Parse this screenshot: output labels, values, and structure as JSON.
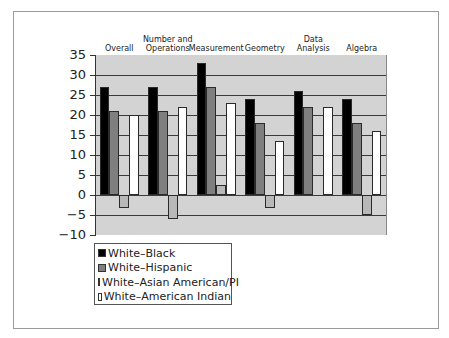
{
  "chart_data": {
    "type": "bar",
    "title": "",
    "xlabel": "",
    "ylabel": "",
    "ylim": [
      -10,
      35
    ],
    "yticks": [
      35,
      30,
      25,
      20,
      15,
      10,
      5,
      0,
      -5,
      -10
    ],
    "ytick_labels": [
      "35",
      "30",
      "25",
      "20",
      "15",
      "10",
      "5",
      "0",
      "−5",
      "−10"
    ],
    "grid": true,
    "legend_position": "bottom-left",
    "categories": [
      "Overall",
      "Number and Operations",
      "Measurement",
      "Geometry",
      "Data Analysis",
      "Algebra"
    ],
    "category_label_lines": [
      [
        "Overall"
      ],
      [
        "Number and",
        "Operations"
      ],
      [
        "Measurement"
      ],
      [
        "Geometry"
      ],
      [
        "Data",
        "Analysis"
      ],
      [
        "Algebra"
      ]
    ],
    "series": [
      {
        "name": "White–Black",
        "color": "#000000",
        "values": [
          27,
          27,
          33,
          24,
          26,
          24
        ]
      },
      {
        "name": "White–Hispanic",
        "color": "#7f7f7f",
        "values": [
          21,
          21,
          27,
          18,
          22,
          18
        ]
      },
      {
        "name": "White–Asian American/PI",
        "color": "#b8b8b8",
        "values": [
          -3.3,
          -6,
          2.5,
          -3.3,
          0,
          -5
        ]
      },
      {
        "name": "White–American Indian",
        "color": "#ffffff",
        "values": [
          20,
          22,
          23,
          13.5,
          22,
          16
        ]
      }
    ]
  },
  "legend": {
    "items": [
      {
        "label": "White–Black",
        "color": "#000000"
      },
      {
        "label": "White–Hispanic",
        "color": "#7f7f7f"
      },
      {
        "label": "White–Asian American/PI",
        "color": "#b8b8b8"
      },
      {
        "label": "White–American Indian",
        "color": "#ffffff"
      }
    ]
  },
  "style": {
    "plot_background": "#d3d3d3",
    "gridline_color": "#3a3a3a"
  }
}
